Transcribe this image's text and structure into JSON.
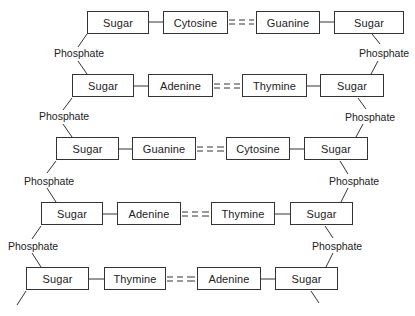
{
  "diagram": {
    "type": "DNA double strand ladder",
    "rows": [
      {
        "left_sugar": "Sugar",
        "left_base": "Cytosine",
        "bond": "= = =",
        "right_base": "Guanine",
        "right_sugar": "Sugar"
      },
      {
        "left_sugar": "Sugar",
        "left_base": "Adenine",
        "bond": "= = =",
        "right_base": "Thymine",
        "right_sugar": "Sugar"
      },
      {
        "left_sugar": "Sugar",
        "left_base": "Guanine",
        "bond": "= = =",
        "right_base": "Cytosine",
        "right_sugar": "Sugar"
      },
      {
        "left_sugar": "Sugar",
        "left_base": "Adenine",
        "bond": "= = =",
        "right_base": "Thymine",
        "right_sugar": "Sugar"
      },
      {
        "left_sugar": "Sugar",
        "left_base": "Thymine",
        "bond": "= = =",
        "right_base": "Adenine",
        "right_sugar": "Sugar"
      }
    ],
    "left_phosphates": [
      "Phosphate",
      "Phosphate",
      "Phosphate",
      "Phosphate"
    ],
    "right_phosphates": [
      "Phosphate",
      "Phosphate",
      "Phosphate",
      "Phosphate"
    ]
  }
}
